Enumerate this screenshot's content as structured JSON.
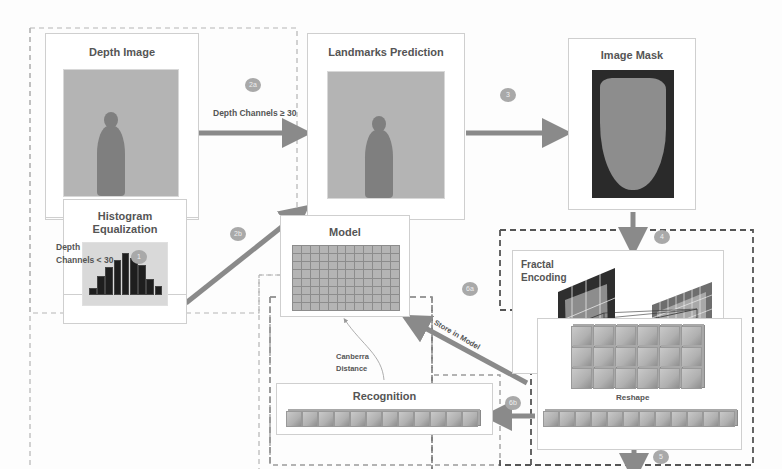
{
  "stages": {
    "depth_image": {
      "title": "Depth Image"
    },
    "landmarks": {
      "title": "Landmarks Prediction"
    },
    "image_mask": {
      "title": "Image Mask"
    },
    "histogram": {
      "title_line1": "Histogram",
      "title_line2": "Equalization"
    },
    "fractal": {
      "title_line1": "Fractal",
      "title_line2": "Encoding"
    },
    "model": {
      "title": "Model"
    },
    "reshape": {
      "title": "Reshape"
    },
    "recognition": {
      "title": "Recognition"
    }
  },
  "edges": {
    "e1": {
      "badge": "1",
      "label_line1": "Depth",
      "label_line2": "Channels < 30"
    },
    "e2a": {
      "badge": "2a",
      "label": "Depth Channels ≥ 30"
    },
    "e2b": {
      "badge": "2b"
    },
    "e3": {
      "badge": "3"
    },
    "e4": {
      "badge": "4"
    },
    "e5": {
      "badge": "5"
    },
    "e6a": {
      "badge": "6a",
      "label": "Store in Model"
    },
    "e6b": {
      "badge": "6b"
    },
    "canberra": {
      "label_line1": "Canberra",
      "label_line2": "Distance"
    }
  },
  "histogram_bars": [
    3,
    8,
    12,
    15,
    18,
    16,
    13,
    7,
    4
  ],
  "colors": {
    "arrow": "#8a8a8a",
    "badge": "#a9a9a9",
    "mask_bg": "#2a2a2a",
    "mask_fg": "#8d8d8d"
  }
}
